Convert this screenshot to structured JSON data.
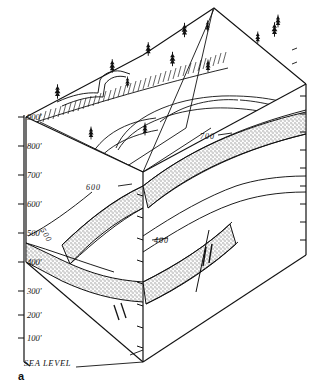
{
  "figure": {
    "label": "a",
    "type": "geologic-block-diagram",
    "background_color": "#ffffff",
    "line_color": "#111111",
    "stipple_color": "#a8a8a8"
  },
  "elevation_scale": {
    "unit": "feet",
    "datum_label": "SEA LEVEL",
    "ticks": [
      {
        "label": "900'",
        "value": 900,
        "y": 117
      },
      {
        "label": "800'",
        "value": 800,
        "y": 146
      },
      {
        "label": "700'",
        "value": 700,
        "y": 175
      },
      {
        "label": "600'",
        "value": 600,
        "y": 204
      },
      {
        "label": "500'",
        "value": 500,
        "y": 233
      },
      {
        "label": "400'",
        "value": 400,
        "y": 262
      },
      {
        "label": "300'",
        "value": 300,
        "y": 291
      },
      {
        "label": "200'",
        "value": 200,
        "y": 315
      },
      {
        "label": "100'",
        "value": 100,
        "y": 338
      }
    ],
    "datum_y": 362
  },
  "contours": [
    {
      "label": "700",
      "value": 700
    },
    {
      "label": "600",
      "value": 600
    },
    {
      "label": "500",
      "value": 500
    },
    {
      "label": "400",
      "value": 400
    }
  ],
  "symbols": {
    "tree": "conifer-tree",
    "stream": "meandering-stream",
    "escarpment": "hachured-escarpment",
    "fault": "fault-with-offset-ticks",
    "stipple": "resistant-sandstone-bed"
  },
  "trees": [
    {
      "x": 57,
      "y": 92
    },
    {
      "x": 112,
      "y": 67
    },
    {
      "x": 128,
      "y": 84
    },
    {
      "x": 148,
      "y": 50
    },
    {
      "x": 184,
      "y": 30
    },
    {
      "x": 207,
      "y": 26
    },
    {
      "x": 208,
      "y": 67
    },
    {
      "x": 258,
      "y": 38
    },
    {
      "x": 274,
      "y": 30
    },
    {
      "x": 277,
      "y": 22
    },
    {
      "x": 91,
      "y": 134
    },
    {
      "x": 145,
      "y": 130
    },
    {
      "x": 174,
      "y": 60
    }
  ]
}
